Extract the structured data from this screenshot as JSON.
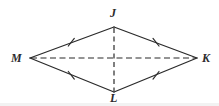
{
  "figure": {
    "name": "rhombus JKLM",
    "background_color": "#ffffff",
    "stroke_color": "#2b2b2b",
    "label_color": "#2b2b2b",
    "vertices": [
      {
        "id": "J",
        "label": "J",
        "x": 114,
        "y": 27,
        "label_x": 110,
        "label_y": 7
      },
      {
        "id": "K",
        "label": "K",
        "x": 197,
        "y": 58,
        "label_x": 202,
        "label_y": 52
      },
      {
        "id": "L",
        "label": "L",
        "x": 114,
        "y": 92,
        "label_x": 110,
        "label_y": 92
      },
      {
        "id": "M",
        "label": "M",
        "x": 30,
        "y": 58,
        "label_x": 11,
        "label_y": 52
      }
    ],
    "sides": [
      {
        "id": "MJ",
        "from": "M",
        "to": "J",
        "style": "solid",
        "tick_marks": 1,
        "tick_x": 71,
        "tick_y": 42
      },
      {
        "id": "JK",
        "from": "J",
        "to": "K",
        "style": "solid",
        "tick_marks": 1,
        "tick_x": 156,
        "tick_y": 42
      },
      {
        "id": "ML",
        "from": "M",
        "to": "L",
        "style": "solid",
        "tick_marks": 1,
        "tick_x": 71,
        "tick_y": 75
      },
      {
        "id": "LK",
        "from": "L",
        "to": "K",
        "style": "solid",
        "tick_marks": 1,
        "tick_x": 156,
        "tick_y": 75
      }
    ],
    "diagonals": [
      {
        "id": "MK",
        "from": "M",
        "to": "K",
        "style": "dashed",
        "orientation": "horizontal"
      },
      {
        "id": "JL",
        "from": "J",
        "to": "L",
        "style": "dashed",
        "orientation": "vertical"
      }
    ]
  }
}
